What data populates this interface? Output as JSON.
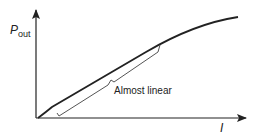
{
  "diagram": {
    "type": "characteristic-curve",
    "y_axis_label": {
      "main": "P",
      "subscript": "out"
    },
    "x_axis_label": "I",
    "annotation": "Almost linear",
    "line_color": "#222222",
    "bracket_color": "#555555"
  }
}
